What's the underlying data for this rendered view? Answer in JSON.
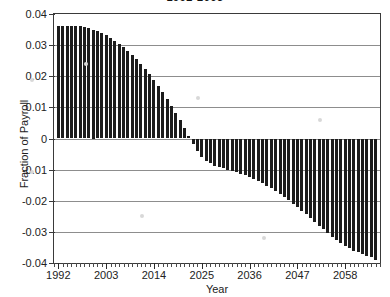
{
  "chart_data": {
    "type": "bar",
    "title": "1992-2065",
    "xlabel": "Year",
    "ylabel": "Fraction of Payroll",
    "xlim": [
      1991.0,
      2066.0
    ],
    "ylim": [
      -0.04,
      0.04
    ],
    "ytick_labels": [
      "0.04",
      "0.03",
      "0.02",
      "0.01",
      "0",
      "-0.01",
      "-0.02",
      "-0.03",
      "-0.04"
    ],
    "ytick_values": [
      0.04,
      0.03,
      0.02,
      0.01,
      0,
      -0.01,
      -0.02,
      -0.03,
      -0.04
    ],
    "xtick_labels": [
      "1992",
      "2003",
      "2014",
      "2025",
      "2036",
      "2047",
      "2058"
    ],
    "xtick_values": [
      1992,
      2003,
      2014,
      2025,
      2036,
      2047,
      2058
    ],
    "xtick_minor_step": 1,
    "grid": "horizontal",
    "legend": "none",
    "bar_color": "#1c1c1c",
    "series_name": "Annual balance as fraction of payroll",
    "x": [
      1992,
      1993,
      1994,
      1995,
      1996,
      1997,
      1998,
      1999,
      2000,
      2001,
      2002,
      2003,
      2004,
      2005,
      2006,
      2007,
      2008,
      2009,
      2010,
      2011,
      2012,
      2013,
      2014,
      2015,
      2016,
      2017,
      2018,
      2019,
      2020,
      2021,
      2022,
      2023,
      2024,
      2025,
      2026,
      2027,
      2028,
      2029,
      2030,
      2031,
      2032,
      2033,
      2034,
      2035,
      2036,
      2037,
      2038,
      2039,
      2040,
      2041,
      2042,
      2043,
      2044,
      2045,
      2046,
      2047,
      2048,
      2049,
      2050,
      2051,
      2052,
      2053,
      2054,
      2055,
      2056,
      2057,
      2058,
      2059,
      2060,
      2061,
      2062,
      2063,
      2064,
      2065
    ],
    "values": [
      0.0362,
      0.0363,
      0.0363,
      0.0362,
      0.0361,
      0.036,
      0.0358,
      0.0354,
      0.035,
      0.0344,
      0.0338,
      0.0331,
      0.0323,
      0.0314,
      0.0304,
      0.0293,
      0.0281,
      0.0268,
      0.0254,
      0.0239,
      0.0223,
      0.0206,
      0.0188,
      0.0169,
      0.0149,
      0.0128,
      0.0106,
      0.0083,
      0.0059,
      0.0034,
      0.0008,
      -0.0019,
      -0.0041,
      -0.0058,
      -0.0071,
      -0.008,
      -0.0087,
      -0.0092,
      -0.0096,
      -0.01,
      -0.0104,
      -0.0108,
      -0.0113,
      -0.0118,
      -0.0124,
      -0.013,
      -0.0137,
      -0.0144,
      -0.0152,
      -0.016,
      -0.0169,
      -0.0178,
      -0.0188,
      -0.0198,
      -0.0209,
      -0.022,
      -0.0232,
      -0.0244,
      -0.0256,
      -0.0268,
      -0.028,
      -0.0292,
      -0.0304,
      -0.0315,
      -0.0326,
      -0.0336,
      -0.0345,
      -0.0353,
      -0.036,
      -0.0366,
      -0.0371,
      -0.0376,
      -0.0381,
      -0.039
    ]
  }
}
